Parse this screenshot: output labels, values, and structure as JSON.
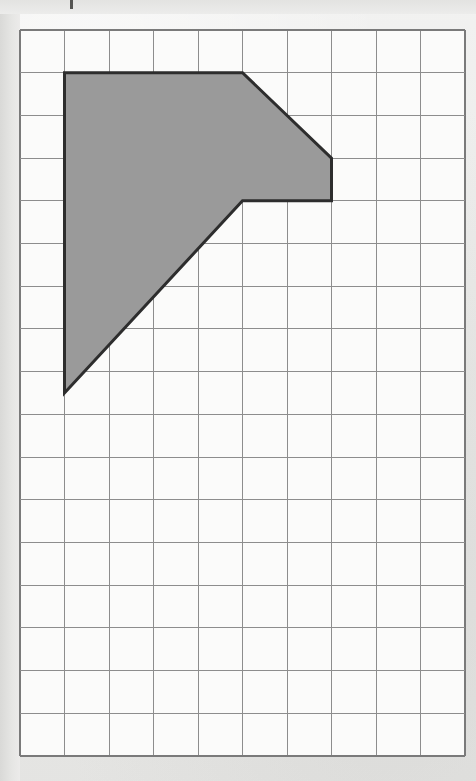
{
  "page": {
    "background_color": "#ececeb",
    "width": 476,
    "height": 781
  },
  "figure": {
    "name": "shaded-polygon-on-grid",
    "grid": {
      "columns": 10,
      "rows": 17,
      "origin_x": 20,
      "origin_y": 30,
      "cell_width": 44.5,
      "cell_height": 42.7,
      "line_color": "#8d8d8d",
      "outer_line_color": "#7a7a7a",
      "cell_fill": "#fbfbfa",
      "grid_visible": true
    },
    "shape": {
      "fill_color": "#9a9a9a",
      "stroke_color": "#2d2d2d",
      "stroke_width": 3,
      "vertices_grid": [
        [
          1,
          1
        ],
        [
          5,
          1
        ],
        [
          7,
          3
        ],
        [
          7,
          4
        ],
        [
          5,
          4
        ],
        [
          1,
          8.5
        ]
      ],
      "vertex_count": 6
    },
    "tick_mark": {
      "x": 70,
      "y": 0,
      "width": 3,
      "height": 9,
      "color": "#555553"
    }
  },
  "chart_data": {
    "type": "scatter",
    "title": "",
    "xlabel": "",
    "ylabel": "",
    "grid": true,
    "xlim": [
      0,
      10
    ],
    "ylim": [
      0,
      17
    ],
    "categories": [
      "polygon-vertex"
    ],
    "series": [
      {
        "name": "shaded-polygon-outline",
        "x": [
          1,
          5,
          7,
          7,
          5,
          1,
          1
        ],
        "y": [
          1,
          1,
          3,
          4,
          4,
          8.5,
          1
        ]
      }
    ],
    "annotations": []
  }
}
